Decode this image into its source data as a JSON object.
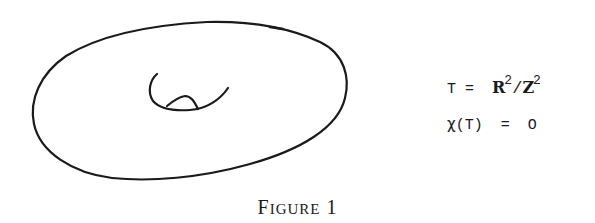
{
  "figure": {
    "caption": {
      "word_initial": "F",
      "word_rest": "IGURE",
      "number": "1"
    },
    "drawing": {
      "subject": "torus",
      "stroke_color": "#1a1a1a",
      "outer_ellipse": "closed hand-drawn oval",
      "inner_hole": "curved arc with small bump"
    },
    "equations": [
      {
        "lhs": "T",
        "equals": "=",
        "numerator": "R",
        "numerator_exp": "2",
        "slash": "/",
        "denominator": "Z",
        "denominator_exp": "2"
      },
      {
        "lhs_function": "χ",
        "lhs_arg_open": "(",
        "lhs_arg": "T",
        "lhs_arg_close": ")",
        "equals": "=",
        "rhs": "O"
      }
    ]
  }
}
